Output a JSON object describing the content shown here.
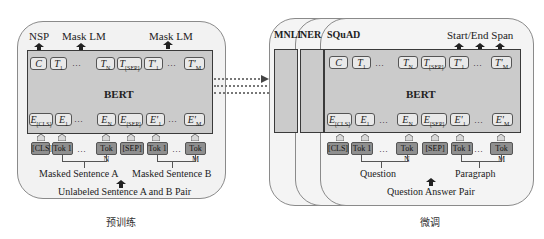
{
  "pretrain": {
    "caption": "预训练",
    "outputs": {
      "nsp": "NSP",
      "mask_lm_1": "Mask LM",
      "mask_lm_2": "Mask LM"
    },
    "model_label": "BERT",
    "top_row": [
      {
        "base": "C",
        "sub": ""
      },
      {
        "base": "T",
        "sub": "1"
      },
      {
        "base": "…",
        "sub": ""
      },
      {
        "base": "T",
        "sub": "N"
      },
      {
        "base": "T",
        "sub": "[SEP]"
      },
      {
        "base": "T'",
        "sub": "1"
      },
      {
        "base": "…",
        "sub": ""
      },
      {
        "base": "T'",
        "sub": "M"
      }
    ],
    "embed_row": [
      {
        "base": "E",
        "sub": "[CLS]"
      },
      {
        "base": "E",
        "sub": "1"
      },
      {
        "base": "…",
        "sub": ""
      },
      {
        "base": "E",
        "sub": "N"
      },
      {
        "base": "E",
        "sub": "[SEP]"
      },
      {
        "base": "E'",
        "sub": "1"
      },
      {
        "base": "…",
        "sub": ""
      },
      {
        "base": "E'",
        "sub": "M"
      }
    ],
    "tokens": [
      "[CLS]",
      "Tok 1",
      "…",
      "Tok N",
      "[SEP]",
      "Tok 1",
      "…",
      "Tok M"
    ],
    "segment_a": "Masked Sentence A",
    "segment_b": "Masked Sentence B",
    "input_label": "Unlabeled Sentence A and B Pair"
  },
  "finetune": {
    "caption": "微调",
    "tasks": [
      "MNLI",
      "NER",
      "SQuAD"
    ],
    "output_label": "Start/End Span",
    "model_label": "BERT",
    "top_row": [
      {
        "base": "C",
        "sub": ""
      },
      {
        "base": "T",
        "sub": "1"
      },
      {
        "base": "…",
        "sub": ""
      },
      {
        "base": "T",
        "sub": "N"
      },
      {
        "base": "T",
        "sub": "[SEP]"
      },
      {
        "base": "T'",
        "sub": "1"
      },
      {
        "base": "…",
        "sub": ""
      },
      {
        "base": "T'",
        "sub": "M"
      }
    ],
    "embed_row": [
      {
        "base": "E",
        "sub": "[CLS]"
      },
      {
        "base": "E",
        "sub": "1"
      },
      {
        "base": "…",
        "sub": ""
      },
      {
        "base": "E",
        "sub": "N"
      },
      {
        "base": "E",
        "sub": "[SEP]"
      },
      {
        "base": "E'",
        "sub": "1"
      },
      {
        "base": "…",
        "sub": ""
      },
      {
        "base": "E'",
        "sub": "M"
      }
    ],
    "tokens": [
      "[CLS]",
      "Tok 1",
      "…",
      "Tok N",
      "[SEP]",
      "Tok 1",
      "…",
      "Tok M"
    ],
    "segment_a": "Question",
    "segment_b": "Paragraph",
    "input_label": "Question Answer Pair"
  },
  "colors": {
    "outer_fill": "#f2f2f2",
    "bert_fill": "#cbcbcb",
    "token_fill": "#8f8f8f",
    "box_fill": "#e9e9e9",
    "arrow": "#333333"
  }
}
